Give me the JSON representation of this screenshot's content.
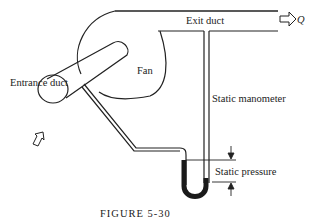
{
  "figure": {
    "caption": "FIGURE 5-30",
    "labels": {
      "exit_duct": "Exit duct",
      "flow": "Q",
      "fan": "Fan",
      "entrance_duct": "Entrance duct",
      "static_manometer": "Static manometer",
      "static_pressure": "Static pressure"
    },
    "colors": {
      "stroke": "#222222",
      "fluid": "#1a1a1a",
      "background": "#ffffff"
    }
  }
}
